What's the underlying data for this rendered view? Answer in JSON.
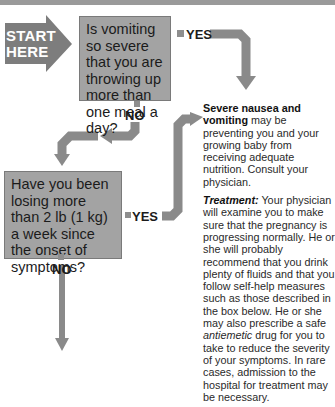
{
  "start": {
    "line1": "START",
    "line2": "HERE"
  },
  "question1": {
    "text": "Is vomiting so severe that you are throwing up more than one meal a day?"
  },
  "question2": {
    "text": "Have you been losing more than 2 lb (1 kg) a week since the onset of symptoms?"
  },
  "labels": {
    "yes1": "YES",
    "no1": "NO",
    "yes2": "YES",
    "no2": "NO"
  },
  "answer": {
    "heading": "Severe nausea and vomiting",
    "para1_rest": " may be preventing you and your growing baby from receiving adequate nutrition. Consult your physician.",
    "treatment_label": "Treatment:",
    "para2_a": " Your physician will examine you to make sure that the pregnancy is progressing normally. He or she will probably recommend that you drink plenty of fluids and that you follow self-help measures such as those described in the box below. He or she may also prescribe a safe ",
    "para2_italic": "antiemetic",
    "para2_b": " drug for you to take to reduce the severity of your symptoms. In rare cases, admission to the hospital for treatment may be necessary."
  },
  "colors": {
    "box": "#a3a3a3",
    "arrow": "#8a8a8a",
    "start": "#7d7d7d"
  }
}
